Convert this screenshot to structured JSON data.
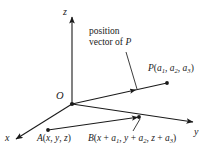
{
  "figure": {
    "type": "3d-coordinate-axes-vector-diagram",
    "background_color": "#ffffff",
    "stroke_color": "#1a1a1a",
    "width": 209,
    "height": 158,
    "axes": {
      "z": {
        "label": "z",
        "x": 65,
        "y": 8
      },
      "y": {
        "label": "y",
        "x": 194,
        "y": 127
      },
      "x": {
        "label": "x",
        "x": 6,
        "y": 133
      }
    },
    "origin": {
      "label": "O",
      "x": 55,
      "y": 90
    },
    "annotation": {
      "line1": "position",
      "line2_pre": "vector of ",
      "line2_var": "P",
      "x": 88,
      "y": 28
    },
    "points": {
      "P": {
        "name": "P",
        "coords": [
          "a",
          "a",
          "a"
        ],
        "subs": [
          "1",
          "2",
          "3"
        ],
        "text": "P(a1, a2, a3)",
        "x": 148,
        "y": 67
      },
      "A": {
        "name": "A",
        "text": "A(x, y, z)",
        "x": 36,
        "y": 136
      },
      "B": {
        "name": "B",
        "text": "B(x + a1, y + a2, z + a3)",
        "x": 88,
        "y": 136
      }
    }
  }
}
